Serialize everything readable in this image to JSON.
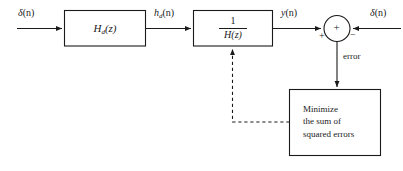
{
  "diagram": {
    "background_color": "#ffffff",
    "line_color": "#1a1a1a",
    "blocks": [
      {
        "id": "hd",
        "name": "desired-system-block",
        "label": "H",
        "label_sub": "d",
        "label_tail": "(z)"
      },
      {
        "id": "inv_h",
        "name": "inverse-filter-block",
        "numerator": "1",
        "denominator": "H(z)"
      },
      {
        "id": "minimize",
        "name": "minimize-block",
        "line1": "Minimize",
        "line2": "the sum of",
        "line3": "squared errors"
      }
    ],
    "signals": {
      "input_delta": "δ(n)",
      "input_delta_ital": "δ",
      "input_delta_arg": "(n)",
      "hd_out": "h",
      "hd_out_sub": "d",
      "hd_out_arg": "(n)",
      "y_out": "y",
      "y_out_arg": "(n)",
      "reference_delta": "δ",
      "reference_delta_arg": "(n)",
      "error": "error"
    },
    "summing_junction": {
      "name": "summing-junction",
      "center_sign": "+",
      "input_sign_left": "+",
      "input_sign_right": "−"
    }
  }
}
